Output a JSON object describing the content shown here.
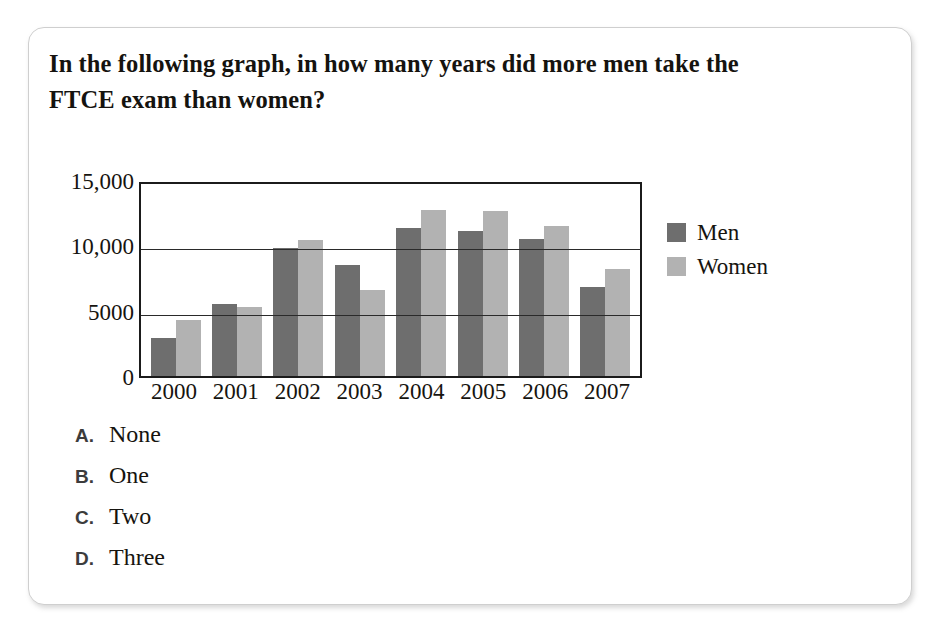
{
  "question": {
    "stem": "In the following graph, in how many years did more men take the FTCE exam than women?",
    "choices": [
      {
        "letter": "A.",
        "text": "None"
      },
      {
        "letter": "B.",
        "text": "One"
      },
      {
        "letter": "C.",
        "text": "Two"
      },
      {
        "letter": "D.",
        "text": "Three"
      }
    ]
  },
  "chart_data": {
    "type": "bar",
    "title": "",
    "xlabel": "",
    "ylabel": "",
    "categories": [
      "2000",
      "2001",
      "2002",
      "2003",
      "2004",
      "2005",
      "2006",
      "2007"
    ],
    "series": [
      {
        "name": "Men",
        "color": "#6e6e6e",
        "values": [
          2900,
          5500,
          9800,
          8500,
          11300,
          11100,
          10500,
          6800
        ]
      },
      {
        "name": "Women",
        "color": "#b2b2b2",
        "values": [
          4300,
          5300,
          10400,
          6600,
          12700,
          12600,
          11500,
          8200
        ]
      }
    ],
    "ylim": [
      0,
      15000
    ],
    "yticks": [
      0,
      5000,
      10000,
      15000
    ],
    "ytick_labels": [
      "0",
      "5000",
      "10,000",
      "15,000"
    ],
    "grid": true,
    "legend_position": "right",
    "legend_entries": [
      "Men",
      "Women"
    ]
  },
  "colors": {
    "men": "#6e6e6e",
    "women": "#b2b2b2",
    "axis": "#1b1b1b",
    "card_border": "#cfcfcf",
    "page_background": "#ffffff"
  }
}
